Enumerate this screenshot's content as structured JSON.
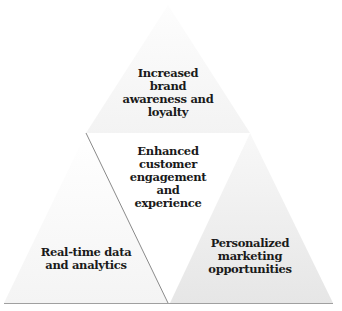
{
  "diagram": {
    "type": "triangle-pyramid",
    "segments": [
      {
        "id": "top",
        "label": "Increased\nbrand\nawareness and\nloyalty",
        "fill": "#f6f6f6"
      },
      {
        "id": "middle",
        "label": "Enhanced\ncustomer\nengagement\nand\nexperience",
        "fill": "#ffffff"
      },
      {
        "id": "bottom-left",
        "label": "Real-time data\nand analytics",
        "fill": "#f8f8f8"
      },
      {
        "id": "bottom-right",
        "label": "Personalized\nmarketing\nopportunities",
        "fill": "#ececec"
      }
    ],
    "colors": {
      "text": "#1a1a1a",
      "baseline": "#9a9a9a",
      "divider": "#8a8a8a"
    }
  }
}
